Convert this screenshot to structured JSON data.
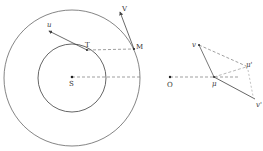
{
  "figure": {
    "left": {
      "labels": {
        "center": "S",
        "inner_point": "T",
        "outer_point": "M",
        "inner_velocity": "u",
        "outer_velocity": "V"
      }
    },
    "right": {
      "labels": {
        "origin": "O",
        "point_mu": "μ",
        "point_v": "v",
        "point_mu_prime": "μ'",
        "point_v_prime": "v'"
      }
    }
  },
  "colors": {
    "stroke": "#555555",
    "dash": "#777777",
    "background": "#ffffff"
  }
}
